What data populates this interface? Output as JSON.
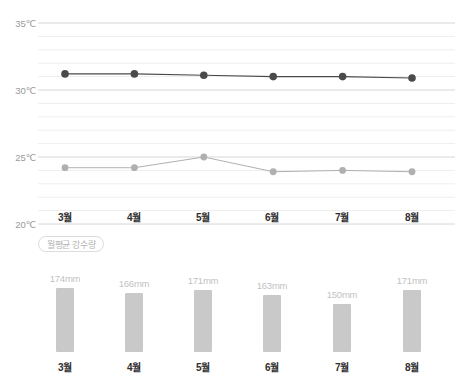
{
  "chart_data": [
    {
      "type": "line",
      "title": "",
      "xlabel": "",
      "ylabel": "",
      "categories": [
        "3월",
        "4월",
        "5월",
        "6월",
        "7월",
        "8월"
      ],
      "ylim": [
        20,
        35
      ],
      "yticks": [
        20,
        25,
        30,
        35
      ],
      "ytick_labels": [
        "20℃",
        "25℃",
        "30℃",
        "35℃"
      ],
      "grid": true,
      "minor_gridlines": true,
      "legend_position": "none",
      "series": [
        {
          "name": "high-temperature",
          "color": "#4a4a4a",
          "values": [
            31.2,
            31.2,
            31.1,
            31.0,
            31.0,
            30.9
          ]
        },
        {
          "name": "low-temperature",
          "color": "#b0b0b0",
          "values": [
            24.2,
            24.2,
            25.0,
            23.9,
            24.0,
            23.9
          ]
        }
      ]
    },
    {
      "type": "bar",
      "title": "월평균 강수량",
      "xlabel": "",
      "ylabel": "",
      "unit": "mm",
      "categories": [
        "3월",
        "4월",
        "5월",
        "6월",
        "7월",
        "8월"
      ],
      "values": [
        174,
        166,
        171,
        163,
        150,
        171
      ],
      "value_labels": [
        "174mm",
        "166mm",
        "171mm",
        "163mm",
        "150mm",
        "171mm"
      ],
      "bar_color": "#c9c9c9",
      "grid": false,
      "legend_position": "none"
    }
  ],
  "temp_chart": {
    "y_axis": {
      "ticks": [
        {
          "label": "35℃",
          "value": 35
        },
        {
          "label": "30℃",
          "value": 30
        },
        {
          "label": "25℃",
          "value": 25
        },
        {
          "label": "20℃",
          "value": 20
        }
      ]
    },
    "x_axis": {
      "labels": [
        "3월",
        "4월",
        "5월",
        "6월",
        "7월",
        "8월"
      ]
    }
  },
  "legend": {
    "rain_badge": "월평균 강수량"
  },
  "rain_chart": {
    "bars": [
      {
        "month": "3월",
        "value": 174,
        "label": "174mm"
      },
      {
        "month": "4월",
        "value": 166,
        "label": "166mm"
      },
      {
        "month": "5월",
        "value": 171,
        "label": "171mm"
      },
      {
        "month": "6월",
        "value": 163,
        "label": "163mm"
      },
      {
        "month": "7월",
        "value": 150,
        "label": "150mm"
      },
      {
        "month": "8월",
        "value": 171,
        "label": "171mm"
      }
    ]
  },
  "colors": {
    "background": "#ffffff",
    "major_grid": "#d6d6d6",
    "minor_grid": "#eeeeee",
    "high_line": "#4a4a4a",
    "low_line": "#b0b0b0",
    "bar": "#c9c9c9",
    "axis_text": "#9a9a9a",
    "month_text": "#2e2e2e",
    "value_text": "#c2c2c2"
  }
}
